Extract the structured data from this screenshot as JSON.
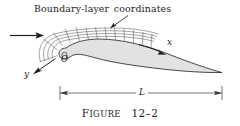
{
  "figure": {
    "caption_lead": "F",
    "caption_rest": "IGURE",
    "caption_number": "12–2",
    "caption_full": "Figure 12–2",
    "annotation": "Boundary-layer coordinates",
    "axis_x_label": "x",
    "axis_y_label": "y",
    "origin_label": "O",
    "length_label": "L",
    "colors": {
      "body_fill": "#e2e2e2",
      "outline": "#2b2b2b",
      "grid_line": "#4a4a4a",
      "dimension_line": "#3a3a3a",
      "background": "#ffffff",
      "text": "#1c1c1c"
    },
    "elements": {
      "freestream_arrow": "flow-arrow",
      "pointer_arrow": "annotation-pointer",
      "body": "airfoil-body",
      "grid": "boundary-layer-grid",
      "dimension": "chord-dimension-line"
    }
  }
}
